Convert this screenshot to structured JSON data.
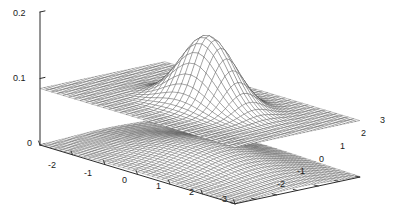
{
  "chart_data": {
    "type": "surface",
    "title": "",
    "xlabel": "",
    "ylabel": "",
    "zlabel": "",
    "grid": false,
    "legend": null,
    "projection": "3d-mesh",
    "zaxis": {
      "ticks": [
        0,
        0.1,
        0.2
      ],
      "tick_labels": [
        "0",
        "0.1",
        "0.2"
      ],
      "zlim": [
        0,
        0.2
      ]
    },
    "xaxis": {
      "ticks": [
        -3,
        -2,
        -1,
        0,
        1,
        2,
        3
      ],
      "tick_labels": [
        "-2",
        "-1",
        "0",
        "1",
        "2",
        "3"
      ],
      "xlim": [
        -3,
        3
      ]
    },
    "yaxis": {
      "ticks": [
        -3,
        -2,
        -1,
        0,
        1,
        2,
        3
      ],
      "tick_labels": [
        "-2",
        "-1",
        "0",
        "1",
        "2",
        "3"
      ],
      "ylim": [
        -3,
        3
      ]
    },
    "series": [
      {
        "name": "upper-plane-with-gaussian-peak",
        "kind": "mesh",
        "description": "flat plane at z=0.085 pierced by a narrow gaussian peak",
        "base_level": 0.085,
        "peak_value": 0.19,
        "peak_center": [
          0.15,
          0.15
        ],
        "peak_sigma": 0.72,
        "grid_n": 34,
        "color": "#3c3c3c"
      },
      {
        "name": "lower-broad-surface",
        "kind": "mesh",
        "description": "near-zero surface with broad gentle mound",
        "base_level": 0.0,
        "peak_value": 0.028,
        "peak_center": [
          0.1,
          0.1
        ],
        "peak_sigma": 1.55,
        "grid_n": 40,
        "color": "#4a4a4a"
      }
    ]
  },
  "axis_labels": {
    "z": [
      {
        "text": "0.2",
        "x": 13,
        "y": 9
      },
      {
        "text": "0.1",
        "x": 13,
        "y": 74
      },
      {
        "text": "0",
        "x": 27,
        "y": 139
      }
    ],
    "x": [
      {
        "text": "-2",
        "x": 48,
        "y": 161
      },
      {
        "text": "-1",
        "x": 84,
        "y": 169
      },
      {
        "text": "0",
        "x": 122,
        "y": 176
      },
      {
        "text": "1",
        "x": 156,
        "y": 182
      },
      {
        "text": "2",
        "x": 189,
        "y": 188
      },
      {
        "text": "3",
        "x": 222,
        "y": 195
      }
    ],
    "y": [
      {
        "text": "-2",
        "x": 277,
        "y": 180
      },
      {
        "text": "-1",
        "x": 297,
        "y": 167
      },
      {
        "text": "0",
        "x": 319,
        "y": 155
      },
      {
        "text": "1",
        "x": 340,
        "y": 142
      },
      {
        "text": "2",
        "x": 361,
        "y": 129
      },
      {
        "text": "3",
        "x": 380,
        "y": 116
      }
    ]
  },
  "colors": {
    "background": "#ffffff",
    "axis": "#2b2b2b",
    "mesh_dark": "#3c3c3c",
    "mesh_light": "#6e6e6e",
    "text": "#1a1a1a"
  }
}
